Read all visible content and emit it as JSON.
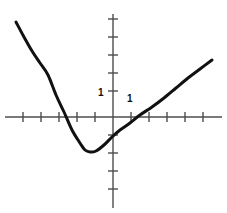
{
  "chart_data": {
    "type": "line",
    "title": "",
    "subtitle": "",
    "xlabel": "",
    "ylabel": "",
    "grid": false,
    "legend": null,
    "annotations": [],
    "axes": {
      "x_axis_label_visible": "1",
      "y_axis_label_visible": "1",
      "x_tick_labels": [
        "1"
      ],
      "y_tick_labels": [
        "1"
      ],
      "x_unit_px": 18,
      "y_unit_px": 18,
      "origin_px": {
        "x": 113,
        "y": 117
      },
      "x_range_data": [
        -6,
        6
      ],
      "y_range_data": [
        -5.5,
        5.5
      ],
      "x_axis_extent_px": [
        5,
        222
      ],
      "y_axis_extent_px": [
        14,
        208
      ],
      "x_tick_positions_px": [
        23,
        41,
        59,
        77,
        95,
        131,
        149,
        167,
        185,
        203
      ],
      "y_tick_positions_px": [
        19,
        37,
        55,
        73,
        91,
        135,
        153,
        171,
        189
      ]
    },
    "series": [
      {
        "name": "parabola",
        "color": "#111111",
        "linewidth_px": 3,
        "equation": "y = 0.5*(x + 1.5)^2 - 3.5",
        "vertex": {
          "x": -1.5,
          "y": -2
        },
        "roots": [
          -3.5,
          2.2
        ],
        "y_intercept": -0.9,
        "points_px": [
          [
            16,
            22
          ],
          [
            24,
            37
          ],
          [
            32,
            51
          ],
          [
            40,
            63
          ],
          [
            48,
            75
          ],
          [
            56,
            95
          ],
          [
            64,
            112
          ],
          [
            72,
            130
          ],
          [
            80,
            143
          ],
          [
            85,
            150
          ],
          [
            90,
            152
          ],
          [
            96,
            151
          ],
          [
            104,
            145
          ],
          [
            112,
            137
          ],
          [
            120,
            130
          ],
          [
            130,
            123
          ],
          [
            140,
            115
          ],
          [
            152,
            107
          ],
          [
            164,
            98
          ],
          [
            176,
            88
          ],
          [
            188,
            78
          ],
          [
            200,
            69
          ],
          [
            212,
            60
          ]
        ]
      }
    ],
    "colors": {
      "curve": "#111111",
      "axis": "#4d4d4d",
      "background": "#ffffff",
      "label": "#111111"
    }
  }
}
